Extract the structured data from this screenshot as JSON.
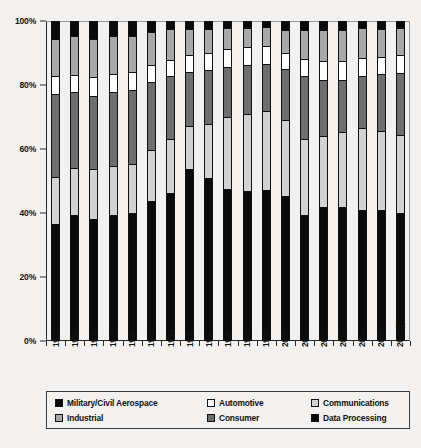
{
  "chart_data": {
    "type": "bar",
    "subtype": "stacked-100-percent",
    "title": "",
    "xlabel": "",
    "ylabel": "",
    "ylim": [
      0,
      100
    ],
    "yticks": [
      "0%",
      "20%",
      "40%",
      "60%",
      "80%",
      "100%"
    ],
    "ytick_values": [
      0,
      20,
      40,
      60,
      80,
      100
    ],
    "grid": false,
    "legend_position": "bottom",
    "stack_order_bottom_to_top": [
      "Data Processing",
      "Communications",
      "Consumer",
      "Automotive",
      "Industrial",
      "Military/Civil Aerospace"
    ],
    "categories": [
      "1988",
      "1989",
      "1990",
      "1991",
      "1992",
      "1993",
      "1994",
      "1995",
      "1996",
      "1997",
      "1998",
      "1999",
      "2000",
      "2001",
      "2002",
      "2003",
      "2004",
      "2005",
      "2006(f)"
    ],
    "series": [
      {
        "name": "Data Processing",
        "color": "#0a0a0a",
        "values": [
          36.3,
          39.0,
          37.6,
          39.0,
          39.6,
          43.5,
          46.0,
          53.5,
          50.7,
          47.3,
          46.7,
          47.0,
          45.0,
          39.0,
          41.6,
          41.5,
          40.7,
          40.7,
          39.6
        ]
      },
      {
        "name": "Communications",
        "color": "#d2d2d2",
        "values": [
          14.7,
          14.9,
          15.9,
          15.3,
          15.3,
          15.9,
          17.0,
          13.5,
          16.8,
          22.4,
          24.2,
          24.8,
          23.8,
          24.0,
          22.4,
          23.7,
          25.7,
          24.6,
          24.5
        ]
      },
      {
        "name": "Consumer",
        "color": "#6e6e6e",
        "values": [
          25.9,
          23.8,
          23.0,
          23.4,
          23.5,
          21.5,
          19.6,
          17.0,
          17.1,
          15.9,
          15.4,
          14.7,
          16.0,
          19.6,
          17.5,
          16.3,
          16.3,
          18.0,
          19.6
        ]
      },
      {
        "name": "Automotive",
        "color": "#ffffff",
        "values": [
          5.7,
          5.2,
          5.8,
          5.7,
          5.6,
          5.4,
          5.1,
          5.4,
          5.5,
          5.6,
          5.5,
          5.7,
          5.0,
          5.4,
          5.8,
          5.8,
          5.6,
          5.4,
          5.5
        ]
      },
      {
        "name": "Industrial",
        "color": "#a8a8a8",
        "values": [
          11.9,
          12.5,
          12.0,
          12.0,
          11.3,
          10.4,
          9.7,
          8.0,
          7.5,
          6.6,
          6.1,
          5.8,
          7.5,
          9.3,
          10.0,
          10.0,
          9.5,
          8.8,
          8.5
        ]
      },
      {
        "name": "Military/Civil Aerospace",
        "color": "#0a0a0a",
        "values": [
          5.5,
          4.6,
          5.7,
          4.6,
          4.7,
          3.3,
          2.6,
          2.6,
          2.4,
          2.2,
          2.1,
          2.0,
          2.7,
          2.7,
          2.7,
          2.7,
          2.2,
          2.5,
          2.3
        ]
      }
    ]
  },
  "axes": {
    "y_ticks": [
      {
        "label": "100%",
        "value": 100
      },
      {
        "label": "80%",
        "value": 80
      },
      {
        "label": "60%",
        "value": 60
      },
      {
        "label": "40%",
        "value": 40
      },
      {
        "label": "20%",
        "value": 20
      },
      {
        "label": "0%",
        "value": 0
      }
    ]
  },
  "legend": {
    "items": [
      {
        "label": "Military/Civil Aerospace",
        "swatch": "#0a0a0a"
      },
      {
        "label": "Automotive",
        "swatch": "#ffffff"
      },
      {
        "label": "Communications",
        "swatch": "#d2d2d2"
      },
      {
        "label": "Industrial",
        "swatch": "#a8a8a8"
      },
      {
        "label": "Consumer",
        "swatch": "#6e6e6e"
      },
      {
        "label": "Data Processing",
        "swatch": "#0a0a0a"
      }
    ]
  }
}
